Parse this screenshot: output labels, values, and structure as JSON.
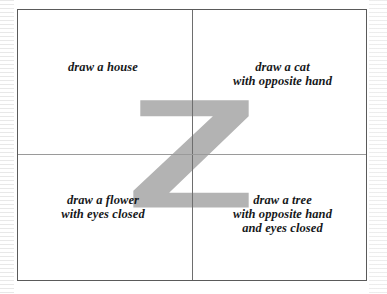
{
  "worksheet": {
    "title_letter": "Z",
    "watermark_color": "#b3b3b3",
    "border_color": "#5a5a5a",
    "rule_color_vertical": "#6e6e6e",
    "rule_color_horizontal": "#9a9a9a",
    "text_color": "#16181a",
    "background_color": "#ffffff",
    "grid": {
      "rows": 2,
      "columns": 2
    },
    "quadrants": [
      {
        "position": "top-left",
        "lines": [
          "draw a house"
        ],
        "text": "draw a house"
      },
      {
        "position": "top-right",
        "lines": [
          "draw a cat",
          "with opposite hand"
        ],
        "text": "draw a cat\nwith opposite hand"
      },
      {
        "position": "bottom-left",
        "lines": [
          "draw a flower",
          "with eyes closed"
        ],
        "text": "draw a flower\nwith eyes closed"
      },
      {
        "position": "bottom-right",
        "lines": [
          "draw a tree",
          "with opposite hand",
          "and eyes closed"
        ],
        "text": "draw a tree\nwith opposite hand\nand eyes closed"
      }
    ]
  }
}
